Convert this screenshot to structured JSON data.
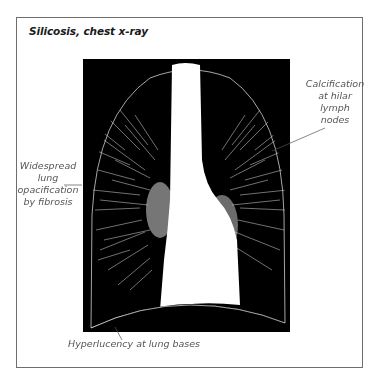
{
  "figure": {
    "title": "Silicosis, chest x-ray",
    "annotations": [
      {
        "id": "calcification",
        "text": "Calcification at hilar lymph nodes",
        "lines": [
          "Calcification",
          "at hilar",
          "lymph",
          "nodes"
        ],
        "position": "right"
      },
      {
        "id": "opacification",
        "text": "Widespread lung opacification by fibrosis",
        "lines": [
          "Widespread",
          "lung",
          "opacification",
          "by fibrosis"
        ],
        "position": "left"
      },
      {
        "id": "hyperlucency",
        "text": "Hyperlucency at lung bases",
        "lines": [
          "Hyperlucency at lung bases"
        ],
        "position": "bottom"
      }
    ],
    "colors": {
      "frame": "#6e6e6e",
      "xray_background": "#000000",
      "mediastinum": "#ffffff",
      "label_text": "#555555",
      "title_text": "#1a1a1a"
    }
  }
}
